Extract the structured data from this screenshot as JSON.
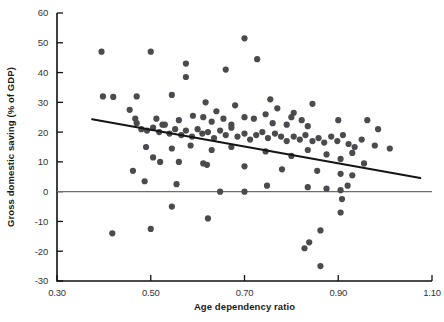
{
  "chart_data": {
    "type": "scatter",
    "title": "",
    "xlabel": "Age dependency ratio",
    "ylabel": "Gross domestic saving (% of GDP)",
    "xlim": [
      0.3,
      1.1
    ],
    "ylim": [
      -30,
      60
    ],
    "xticks": [
      0.3,
      0.5,
      0.7,
      0.9,
      1.1
    ],
    "xticklabels": [
      "0.30",
      "0.50",
      "0.70",
      "0.90",
      "1.10"
    ],
    "yticks": [
      -30,
      -20,
      -10,
      0,
      10,
      20,
      30,
      40,
      50,
      60
    ],
    "yticklabels": [
      "-30",
      "-20",
      "-10",
      "0",
      "10",
      "20",
      "30",
      "40",
      "50",
      "60"
    ],
    "grid": false,
    "legend": null,
    "marker_color": "#4b4b4f",
    "marker_size": 3.1,
    "zero_line": {
      "y": 0,
      "color": "#6e6e6e"
    },
    "trend_line": {
      "type": "linear-fit",
      "color": "#151515",
      "x_start": 0.375,
      "y_start": 24.3,
      "x_end": 1.075,
      "y_end": 4.6
    },
    "points": [
      [
        0.395,
        47.0
      ],
      [
        0.5,
        47.0
      ],
      [
        0.575,
        43.0
      ],
      [
        0.7,
        51.5
      ],
      [
        0.575,
        38.5
      ],
      [
        0.66,
        41.0
      ],
      [
        0.727,
        44.5
      ],
      [
        0.398,
        32.0
      ],
      [
        0.42,
        31.8
      ],
      [
        0.47,
        32.0
      ],
      [
        0.545,
        32.5
      ],
      [
        0.617,
        30.0
      ],
      [
        0.68,
        29.0
      ],
      [
        0.755,
        31.0
      ],
      [
        0.77,
        28.0
      ],
      [
        0.805,
        26.5
      ],
      [
        0.845,
        29.5
      ],
      [
        0.455,
        27.5
      ],
      [
        0.467,
        24.5
      ],
      [
        0.47,
        23.0
      ],
      [
        0.512,
        24.5
      ],
      [
        0.525,
        22.5
      ],
      [
        0.56,
        24.0
      ],
      [
        0.59,
        25.5
      ],
      [
        0.612,
        25.0
      ],
      [
        0.63,
        23.5
      ],
      [
        0.64,
        27.0
      ],
      [
        0.655,
        24.5
      ],
      [
        0.672,
        22.5
      ],
      [
        0.7,
        25.0
      ],
      [
        0.72,
        24.5
      ],
      [
        0.745,
        26.0
      ],
      [
        0.76,
        23.0
      ],
      [
        0.79,
        22.5
      ],
      [
        0.8,
        25.0
      ],
      [
        0.822,
        24.0
      ],
      [
        0.835,
        22.0
      ],
      [
        0.9,
        24.0
      ],
      [
        0.962,
        24.0
      ],
      [
        0.985,
        21.0
      ],
      [
        0.48,
        21.0
      ],
      [
        0.492,
        20.5
      ],
      [
        0.505,
        21.5
      ],
      [
        0.518,
        20.0
      ],
      [
        0.53,
        22.5
      ],
      [
        0.54,
        19.5
      ],
      [
        0.552,
        21.0
      ],
      [
        0.565,
        19.0
      ],
      [
        0.575,
        20.5
      ],
      [
        0.588,
        18.5
      ],
      [
        0.6,
        21.0
      ],
      [
        0.61,
        19.5
      ],
      [
        0.622,
        20.0
      ],
      [
        0.635,
        18.0
      ],
      [
        0.648,
        20.5
      ],
      [
        0.66,
        19.0
      ],
      [
        0.672,
        21.5
      ],
      [
        0.685,
        18.5
      ],
      [
        0.7,
        19.5
      ],
      [
        0.712,
        17.5
      ],
      [
        0.725,
        19.0
      ],
      [
        0.738,
        20.0
      ],
      [
        0.75,
        18.0
      ],
      [
        0.765,
        19.5
      ],
      [
        0.778,
        18.5
      ],
      [
        0.79,
        17.0
      ],
      [
        0.805,
        18.5
      ],
      [
        0.818,
        17.5
      ],
      [
        0.83,
        19.0
      ],
      [
        0.845,
        17.0
      ],
      [
        0.858,
        18.0
      ],
      [
        0.87,
        16.5
      ],
      [
        0.885,
        18.5
      ],
      [
        0.898,
        17.0
      ],
      [
        0.91,
        19.0
      ],
      [
        0.922,
        16.0
      ],
      [
        0.935,
        15.0
      ],
      [
        0.95,
        17.5
      ],
      [
        0.978,
        15.5
      ],
      [
        1.01,
        14.5
      ],
      [
        0.49,
        15.0
      ],
      [
        0.545,
        14.5
      ],
      [
        0.585,
        15.5
      ],
      [
        0.63,
        14.0
      ],
      [
        0.672,
        15.0
      ],
      [
        0.745,
        13.5
      ],
      [
        0.8,
        12.0
      ],
      [
        0.835,
        14.0
      ],
      [
        0.875,
        12.5
      ],
      [
        0.905,
        11.0
      ],
      [
        0.93,
        13.0
      ],
      [
        0.955,
        9.5
      ],
      [
        0.505,
        11.5
      ],
      [
        0.56,
        10.0
      ],
      [
        0.62,
        9.0
      ],
      [
        0.7,
        8.5
      ],
      [
        0.78,
        7.5
      ],
      [
        0.855,
        7.0
      ],
      [
        0.905,
        6.0
      ],
      [
        0.93,
        5.5
      ],
      [
        0.462,
        7.0
      ],
      [
        0.52,
        10.0
      ],
      [
        0.487,
        3.5
      ],
      [
        0.555,
        2.5
      ],
      [
        0.612,
        9.5
      ],
      [
        0.748,
        2.0
      ],
      [
        0.835,
        1.5
      ],
      [
        0.875,
        1.0
      ],
      [
        0.905,
        0.5
      ],
      [
        0.92,
        2.0
      ],
      [
        0.648,
        0.0
      ],
      [
        0.7,
        0.0
      ],
      [
        0.545,
        -5.0
      ],
      [
        0.622,
        -9.0
      ],
      [
        0.5,
        -12.5
      ],
      [
        0.418,
        -14.0
      ],
      [
        0.908,
        -2.5
      ],
      [
        0.905,
        -7.0
      ],
      [
        0.862,
        -13.0
      ],
      [
        0.838,
        -17.0
      ],
      [
        0.828,
        -19.0
      ],
      [
        0.862,
        -25.0
      ]
    ]
  }
}
